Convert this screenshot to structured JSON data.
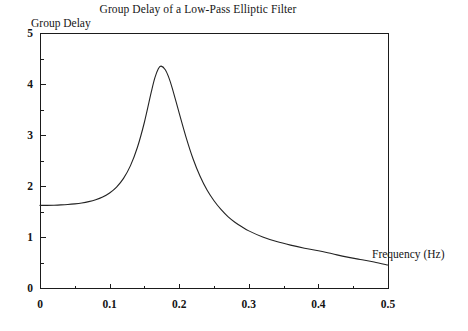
{
  "chart_data": {
    "type": "line",
    "title": "Group Delay of a Low-Pass Elliptic Filter",
    "xlabel": "Frequency (Hz)",
    "ylabel": "Group Delay",
    "xlim": [
      0,
      0.5
    ],
    "ylim": [
      0,
      5
    ],
    "xticks": [
      "0",
      "0.1",
      "0.2",
      "0.3",
      "0.4",
      "0.5"
    ],
    "xtick_values": [
      0,
      0.1,
      0.2,
      0.3,
      0.4,
      0.5
    ],
    "xminor_step": 0.05,
    "yticks": [
      "0",
      "1",
      "2",
      "3",
      "4",
      "5"
    ],
    "ytick_values": [
      0,
      1,
      2,
      3,
      4,
      5
    ],
    "yminor_step": 0.5,
    "grid": false,
    "legend": null,
    "line_color": "#232323",
    "axis_color": "#1b1b1b",
    "background_color": "#ffffff",
    "peak": {
      "x": 0.174,
      "y": 4.35
    },
    "start_value": 1.62,
    "end_value": 0.45,
    "x": [
      0.0,
      0.01,
      0.02,
      0.03,
      0.04,
      0.05,
      0.06,
      0.07,
      0.08,
      0.09,
      0.1,
      0.11,
      0.12,
      0.13,
      0.14,
      0.15,
      0.16,
      0.165,
      0.17,
      0.174,
      0.18,
      0.185,
      0.19,
      0.2,
      0.21,
      0.22,
      0.23,
      0.24,
      0.25,
      0.26,
      0.27,
      0.28,
      0.29,
      0.3,
      0.32,
      0.34,
      0.36,
      0.38,
      0.4,
      0.42,
      0.44,
      0.46,
      0.48,
      0.5
    ],
    "y": [
      1.62,
      1.621,
      1.624,
      1.629,
      1.637,
      1.65,
      1.668,
      1.694,
      1.731,
      1.785,
      1.864,
      1.98,
      2.15,
      2.4,
      2.76,
      3.25,
      3.85,
      4.12,
      4.3,
      4.35,
      4.28,
      4.13,
      3.92,
      3.43,
      2.95,
      2.53,
      2.19,
      1.92,
      1.71,
      1.54,
      1.4,
      1.29,
      1.2,
      1.12,
      1.0,
      0.91,
      0.84,
      0.78,
      0.73,
      0.67,
      0.61,
      0.56,
      0.51,
      0.45
    ]
  },
  "axes_geometry": {
    "left_px": 40,
    "right_px": 388,
    "top_px": 33,
    "bottom_px": 288
  }
}
